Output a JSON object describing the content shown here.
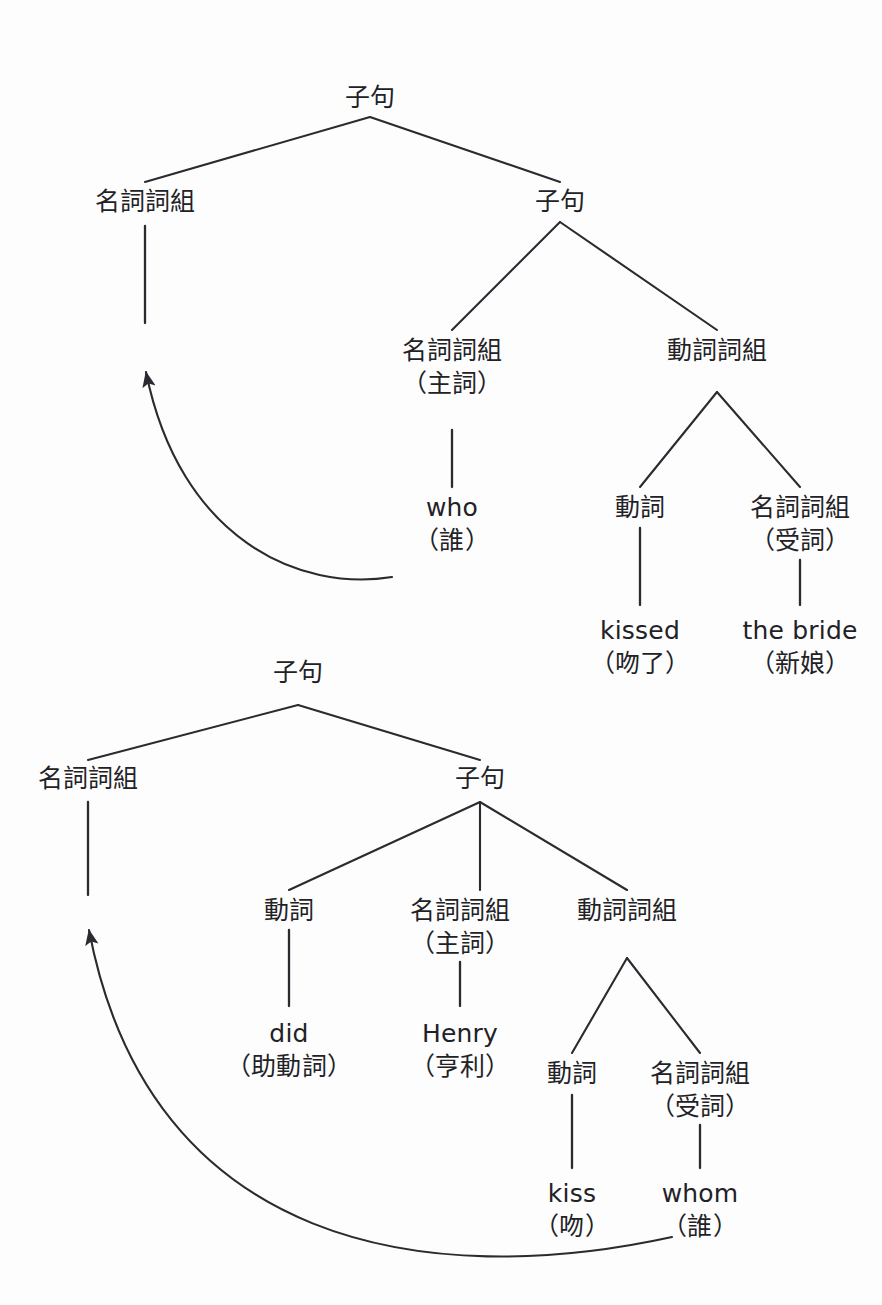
{
  "page": {
    "background_color": "#fdfdfd",
    "line_color": "#2a2a30",
    "text_color": "#222226"
  },
  "diagram": {
    "type": "syntax-tree",
    "trees": [
      {
        "id": "tree-1",
        "sentence_gloss": "who kissed the bride",
        "nodes": {
          "root": {
            "label": "子句"
          },
          "left_np": {
            "label": "名詞詞組"
          },
          "inner_clause": {
            "label": "子句"
          },
          "subject_np_line1": "名詞詞組",
          "subject_np_line2": "（主詞）",
          "vp": {
            "label": "動詞詞組"
          },
          "verb": {
            "label": "動詞"
          },
          "object_np_line1": "名詞詞組",
          "object_np_line2": "（受詞）",
          "leaf_who_line1": "who",
          "leaf_who_line2": "（誰）",
          "leaf_kissed_line1": "kissed",
          "leaf_kissed_line2": "（吻了）",
          "leaf_bride_line1": "the bride",
          "leaf_bride_line2": "（新娘）"
        },
        "movement_arrow": {
          "from": "who",
          "to": "名詞詞組",
          "direction": "leftward-upward"
        }
      },
      {
        "id": "tree-2",
        "sentence_gloss": "whom did Henry kiss",
        "nodes": {
          "root": {
            "label": "子句"
          },
          "left_np": {
            "label": "名詞詞組"
          },
          "inner_clause": {
            "label": "子句"
          },
          "aux_verb": {
            "label": "動詞"
          },
          "subject_np_line1": "名詞詞組",
          "subject_np_line2": "（主詞）",
          "vp": {
            "label": "動詞詞組"
          },
          "verb": {
            "label": "動詞"
          },
          "object_np_line1": "名詞詞組",
          "object_np_line2": "（受詞）",
          "leaf_did_line1": "did",
          "leaf_did_line2": "（助動詞）",
          "leaf_henry_line1": "Henry",
          "leaf_henry_line2": "（亨利）",
          "leaf_kiss_line1": "kiss",
          "leaf_kiss_line2": "（吻）",
          "leaf_whom_line1": "whom",
          "leaf_whom_line2": "（誰）"
        },
        "movement_arrow": {
          "from": "whom",
          "to": "名詞詞組",
          "direction": "leftward-upward"
        }
      }
    ]
  }
}
